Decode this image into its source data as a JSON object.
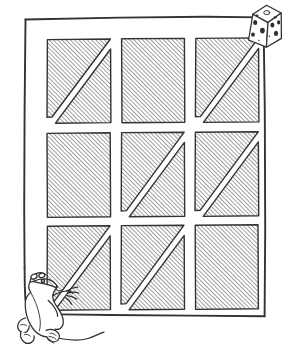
{
  "scene": {
    "title": "Mouse and Cheese Grid Puzzle",
    "description": "Hand-drawn line illustration: a three-by-three grid of diagonally hatched squares inside a square frame, with a cartoon mouse standing at the lower left reaching toward a cube of holey cheese floating at the upper right.",
    "style": "hand-drawn-ink-sketch",
    "background_color": "#ffffff",
    "ink_color": "#2b2b2b",
    "hatch_color": "#555555"
  },
  "frame": {
    "name": "outer-frame",
    "x": 24,
    "y": 17,
    "width": 242,
    "height": 300,
    "stroke_color": "#2f2f2f",
    "stroke_width": 2
  },
  "grid": {
    "rows": 3,
    "columns": 3,
    "cell_width": 63,
    "cell_height": 84,
    "gap_x": 11,
    "gap_y": 9,
    "origin_x": 47,
    "origin_y": 39,
    "hatch_angle_degrees": 45,
    "hatch_spacing": 3,
    "cells": [
      {
        "id": "cell-r1c1",
        "row": 1,
        "column": 1,
        "fill": "split-diagonal",
        "split_direction": "bottom-left-to-top-right",
        "hatched_parts": [
          "upper-left-triangle",
          "lower-right-triangle"
        ]
      },
      {
        "id": "cell-r1c2",
        "row": 1,
        "column": 2,
        "fill": "full",
        "split_direction": "none",
        "hatched_parts": [
          "whole-square"
        ]
      },
      {
        "id": "cell-r1c3",
        "row": 1,
        "column": 3,
        "fill": "split-diagonal",
        "split_direction": "bottom-left-to-top-right",
        "hatched_parts": [
          "upper-left-triangle",
          "lower-right-triangle"
        ]
      },
      {
        "id": "cell-r2c1",
        "row": 2,
        "column": 1,
        "fill": "full",
        "split_direction": "none",
        "hatched_parts": [
          "whole-square"
        ]
      },
      {
        "id": "cell-r2c2",
        "row": 2,
        "column": 2,
        "fill": "split-diagonal",
        "split_direction": "bottom-left-to-top-right",
        "hatched_parts": [
          "upper-left-triangle",
          "lower-right-triangle"
        ]
      },
      {
        "id": "cell-r2c3",
        "row": 2,
        "column": 3,
        "fill": "split-diagonal",
        "split_direction": "bottom-left-to-top-right",
        "hatched_parts": [
          "upper-left-triangle",
          "lower-right-triangle"
        ]
      },
      {
        "id": "cell-r3c1",
        "row": 3,
        "column": 1,
        "fill": "split-diagonal",
        "split_direction": "bottom-left-to-top-right",
        "hatched_parts": [
          "upper-left-triangle",
          "lower-right-triangle"
        ]
      },
      {
        "id": "cell-r3c2",
        "row": 3,
        "column": 2,
        "fill": "split-diagonal",
        "split_direction": "bottom-left-to-top-right",
        "hatched_parts": [
          "upper-left-triangle",
          "lower-right-triangle"
        ]
      },
      {
        "id": "cell-r3c3",
        "row": 3,
        "column": 3,
        "fill": "full",
        "split_direction": "none",
        "hatched_parts": [
          "whole-square"
        ]
      }
    ]
  },
  "cheese": {
    "name": "cheese-cube",
    "label": "cube of holey cheese",
    "x": 243,
    "y": 4,
    "width": 38,
    "height": 44,
    "hole_count": 11,
    "hole_color": "#2b2b2b"
  },
  "mouse": {
    "name": "mouse",
    "label": "cartoon mouse standing on hind legs",
    "x": 4,
    "y": 270,
    "width": 104,
    "height": 82,
    "pose": "standing-reaching-up-right",
    "has_tail": true,
    "tail_direction": "right"
  }
}
